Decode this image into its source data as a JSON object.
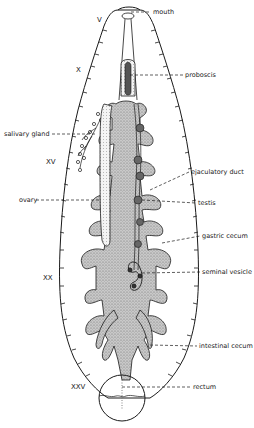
{
  "diagram": {
    "segment_markers": [
      {
        "label": "V",
        "x": 97,
        "y": 20
      },
      {
        "label": "X",
        "x": 76,
        "y": 70
      },
      {
        "label": "XV",
        "x": 46,
        "y": 162
      },
      {
        "label": "XX",
        "x": 43,
        "y": 278
      },
      {
        "label": "XXV",
        "x": 71,
        "y": 387
      }
    ],
    "labels": [
      {
        "id": "mouth",
        "text": "mouth",
        "x": 153,
        "y": 9,
        "side": "right"
      },
      {
        "id": "proboscis",
        "text": "proboscis",
        "x": 185,
        "y": 72,
        "side": "right"
      },
      {
        "id": "salivary-gland",
        "text": "salivary gland",
        "x": 4,
        "y": 131,
        "side": "left"
      },
      {
        "id": "ejaculatory-duct",
        "text": "ejaculatory duct",
        "x": 191,
        "y": 169,
        "side": "right"
      },
      {
        "id": "ovary",
        "text": "ovary",
        "x": 19,
        "y": 198,
        "side": "left"
      },
      {
        "id": "testis",
        "text": "testis",
        "x": 198,
        "y": 200,
        "side": "right"
      },
      {
        "id": "gastric-cecum",
        "text": "gastric cecum",
        "x": 202,
        "y": 234,
        "side": "right"
      },
      {
        "id": "seminal-vesicle",
        "text": "seminal vesicle",
        "x": 202,
        "y": 269,
        "side": "right"
      },
      {
        "id": "intestinal-cecum",
        "text": "intestinal cecum",
        "x": 199,
        "y": 344,
        "side": "right"
      },
      {
        "id": "rectum",
        "text": "rectum",
        "x": 193,
        "y": 385,
        "side": "right"
      }
    ],
    "colors": {
      "line": "#1a1a1a",
      "stipple": "#9a9a9a",
      "gut_fill": "#b8b8b8",
      "background": "#ffffff"
    }
  }
}
